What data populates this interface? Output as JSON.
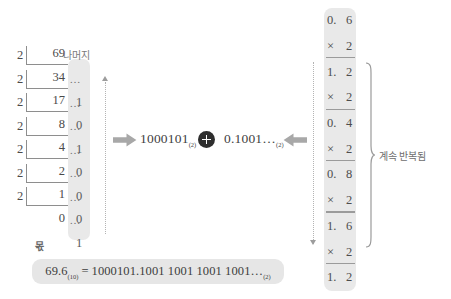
{
  "diagram": {
    "title_concept": "69.6 decimal to binary conversion",
    "division": {
      "label_remainder": "나머지",
      "label_quotient": "몫",
      "divisor": "2",
      "dots": "…",
      "rows": [
        {
          "divisor": "2",
          "dividend": "69",
          "dots": "",
          "remainder": ""
        },
        {
          "divisor": "2",
          "dividend": "34",
          "dots": "…",
          "remainder": "1"
        },
        {
          "divisor": "2",
          "dividend": "17",
          "dots": "…",
          "remainder": "0"
        },
        {
          "divisor": "2",
          "dividend": "8",
          "dots": "…",
          "remainder": "1"
        },
        {
          "divisor": "2",
          "dividend": "4",
          "dots": "…",
          "remainder": "0"
        },
        {
          "divisor": "2",
          "dividend": "2",
          "dots": "…",
          "remainder": "0"
        },
        {
          "divisor": "2",
          "dividend": "1",
          "dots": "…",
          "remainder": "0"
        },
        {
          "divisor": "",
          "dividend": "0",
          "dots": "…",
          "remainder": "1"
        }
      ]
    },
    "expression": {
      "left_value": "1000101",
      "left_base": "(2)",
      "operator": "+",
      "right_value": "0.1001…",
      "right_base": "(2)"
    },
    "multiplication": {
      "label_repeat": "계속 반복됨",
      "rows": [
        {
          "a": "0.",
          "b": "6",
          "ruled": false
        },
        {
          "a": "×",
          "b": "2",
          "ruled": true
        },
        {
          "a": "1.",
          "b": "2",
          "ruled": false
        },
        {
          "a": "×",
          "b": "2",
          "ruled": true
        },
        {
          "a": "0.",
          "b": "4",
          "ruled": false
        },
        {
          "a": "×",
          "b": "2",
          "ruled": true
        },
        {
          "a": "0.",
          "b": "8",
          "ruled": false
        },
        {
          "a": "×",
          "b": "2",
          "ruled": true
        },
        {
          "a": "1.",
          "b": "6",
          "ruled": false
        },
        {
          "a": "×",
          "b": "2",
          "ruled": true
        },
        {
          "a": "1.",
          "b": "2",
          "ruled": false
        }
      ]
    },
    "result": {
      "lhs_value": "69.6",
      "lhs_base": "(10)",
      "equals": "=",
      "rhs_value": "1000101.1001  1001  1001  1001…",
      "rhs_base": "(2)"
    },
    "colors": {
      "highlight_gray": "#e9e9e9",
      "banner_gray": "#e6e6e6",
      "arrow_gray": "#a8a8a8",
      "badge_dark": "#2e2e2e",
      "text_gray": "#3f3f3f"
    }
  }
}
